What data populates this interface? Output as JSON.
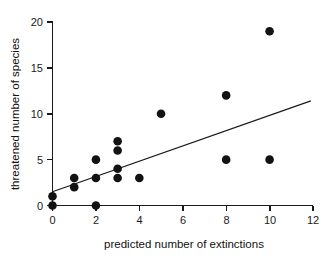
{
  "chart_data": {
    "type": "scatter",
    "title": "",
    "xlabel": "predicted number of extinctions",
    "ylabel": "threatened number of species",
    "xlim": [
      0,
      12
    ],
    "ylim": [
      0,
      20
    ],
    "xticks": [
      0,
      2,
      4,
      6,
      8,
      10,
      12
    ],
    "xtick_labels": [
      "0",
      "2",
      "4",
      "6",
      "8",
      "10",
      "12"
    ],
    "yticks": [
      0,
      5,
      10,
      15,
      20
    ],
    "ytick_labels": [
      "0",
      "5",
      "10",
      "15",
      "20"
    ],
    "grid": false,
    "legend": null,
    "marker": "filled-circle",
    "marker_color": "#121212",
    "points": [
      {
        "x": 0,
        "y": 0
      },
      {
        "x": 0,
        "y": 1
      },
      {
        "x": 1,
        "y": 2
      },
      {
        "x": 1,
        "y": 3
      },
      {
        "x": 2,
        "y": 0
      },
      {
        "x": 2,
        "y": 3
      },
      {
        "x": 2,
        "y": 5
      },
      {
        "x": 3,
        "y": 3
      },
      {
        "x": 3,
        "y": 4
      },
      {
        "x": 3,
        "y": 6
      },
      {
        "x": 3,
        "y": 7
      },
      {
        "x": 4,
        "y": 3
      },
      {
        "x": 5,
        "y": 10
      },
      {
        "x": 8,
        "y": 5
      },
      {
        "x": 8,
        "y": 12
      },
      {
        "x": 10,
        "y": 5
      },
      {
        "x": 10,
        "y": 19
      }
    ],
    "fit_line": {
      "type": "linear-regression",
      "x_start": 0,
      "y_start": 1.5,
      "x_end": 11.9,
      "y_end": 11.4,
      "color": "#1a1a1a"
    }
  },
  "axes": {
    "x_title": "predicted number of extinctions",
    "y_title": "threatened number of species",
    "x_tick_labels": [
      "0",
      "2",
      "4",
      "6",
      "8",
      "10",
      "12"
    ],
    "y_tick_labels": [
      "0",
      "5",
      "10",
      "15",
      "20"
    ]
  }
}
